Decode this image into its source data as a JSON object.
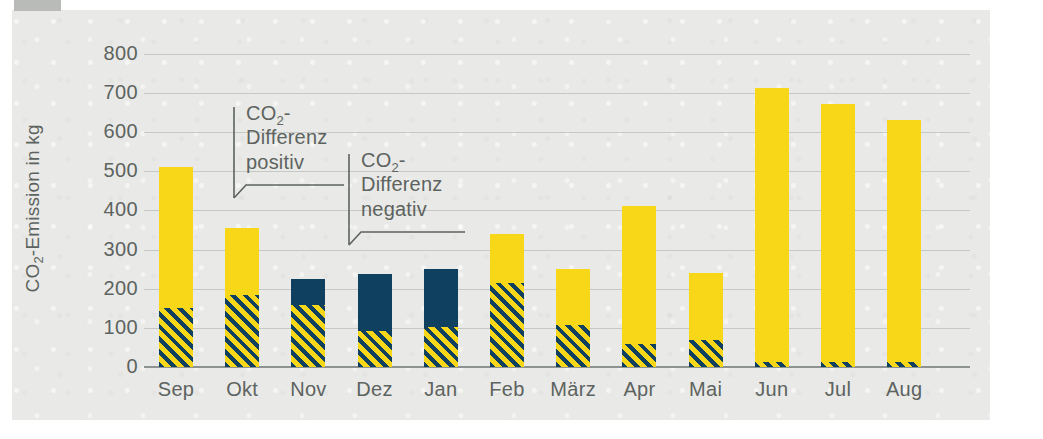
{
  "chart_data": {
    "type": "bar",
    "title": "",
    "subtitle": "",
    "xlabel": "",
    "ylabel": "CO2-Emission in kg",
    "ylabel_rich": {
      "pre": "CO",
      "sub": "2",
      "post": "-Emission in kg"
    },
    "ylim": [
      0,
      800
    ],
    "yticks": [
      800,
      700,
      600,
      500,
      400,
      300,
      200,
      100,
      0
    ],
    "grid": true,
    "legend_position": "none",
    "categories": [
      "Sep",
      "Okt",
      "Nov",
      "Dez",
      "Jan",
      "Feb",
      "März",
      "Apr",
      "Mai",
      "Jun",
      "Jul",
      "Aug"
    ],
    "series": [
      {
        "name": "Hatched base (CO2-Basis)",
        "style": "hatched",
        "values": [
          150,
          185,
          158,
          92,
          103,
          215,
          108,
          58,
          68,
          12,
          12,
          12
        ]
      },
      {
        "name": "CO2-Differenz positiv",
        "style": "solid-yellow",
        "values": [
          360,
          170,
          0,
          0,
          0,
          125,
          142,
          354,
          172,
          700,
          661,
          620
        ]
      },
      {
        "name": "CO2-Differenz negativ",
        "style": "solid-navy",
        "values": [
          0,
          0,
          67,
          145,
          147,
          0,
          0,
          0,
          0,
          0,
          0,
          0
        ]
      }
    ],
    "totals": [
      510,
      355,
      225,
      237,
      250,
      340,
      250,
      412,
      240,
      712,
      673,
      632
    ],
    "bar_types": [
      "positive",
      "positive",
      "negative",
      "negative",
      "negative",
      "positive",
      "positive",
      "positive",
      "positive",
      "positive",
      "positive",
      "positive"
    ],
    "colors": {
      "yellow": "#F8D618",
      "navy": "#10405F",
      "grid": "#c6c8c5",
      "axis": "#8e9290",
      "text": "#5d6360",
      "page": "#e9eae7"
    },
    "annotations": [
      {
        "id": "positive",
        "lines": [
          "CO2-",
          "Differenz",
          "positiv"
        ],
        "line1_rich": {
          "pre": "CO",
          "sub": "2",
          "post": "-"
        },
        "line2": "Differenz",
        "line3": "positiv",
        "points_to": "Okt"
      },
      {
        "id": "negative",
        "lines": [
          "CO2-",
          "Differenz",
          "negativ"
        ],
        "line1_rich": {
          "pre": "CO",
          "sub": "2",
          "post": "-"
        },
        "line2": "Differenz",
        "line3": "negativ",
        "points_to": "Dez"
      }
    ]
  }
}
